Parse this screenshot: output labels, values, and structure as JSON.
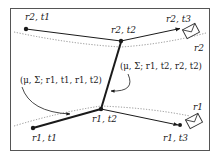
{
  "diagram": {
    "type": "trajectory-diagram",
    "frame": {
      "stroke": "#555555"
    },
    "nodes": {
      "r2_t1": {
        "label": "r2, t1",
        "x": 26,
        "y": 29
      },
      "r2_t2": {
        "label": "r2, t2",
        "x": 121,
        "y": 41
      },
      "r2_t3": {
        "label": "r2, t3",
        "x": 181,
        "y": 28
      },
      "r1_t1": {
        "label": "r1, t1",
        "x": 33,
        "y": 128
      },
      "r1_t2": {
        "label": "r1, t2",
        "x": 101,
        "y": 109
      },
      "r1_t3": {
        "label": "r1, t3",
        "x": 180,
        "y": 125
      }
    },
    "receivers": {
      "r2": {
        "label": "r2"
      },
      "r1": {
        "label": "r1"
      }
    },
    "annotations": {
      "left": "(μ, Σ; r1, t1, r1, t2)",
      "right": "(μ, Σ; r1, t2, r2, t2)"
    },
    "icons": {
      "envelope_r2": "envelope-icon",
      "envelope_r1": "envelope-icon"
    },
    "colors": {
      "ink": "#1a1a1a",
      "dotted": "#777777"
    }
  }
}
